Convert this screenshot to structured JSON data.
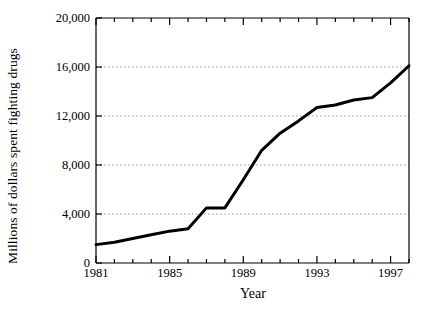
{
  "chart_data": {
    "type": "line",
    "title": "",
    "xlabel": "Year",
    "ylabel": "Millions of dollars spent fighting drugs",
    "x": [
      1981,
      1982,
      1983,
      1984,
      1985,
      1986,
      1987,
      1988,
      1989,
      1990,
      1991,
      1992,
      1993,
      1994,
      1995,
      1996,
      1997,
      1998
    ],
    "values": [
      1500,
      1700,
      2000,
      2300,
      2600,
      2800,
      4500,
      4500,
      6800,
      9200,
      10600,
      11600,
      12700,
      12900,
      13300,
      13500,
      14700,
      16100
    ],
    "series": [
      {
        "name": "Millions of dollars spent fighting drugs",
        "values": [
          1500,
          1700,
          2000,
          2300,
          2600,
          2800,
          4500,
          4500,
          6800,
          9200,
          10600,
          11600,
          12700,
          12900,
          13300,
          13500,
          14700,
          16100
        ]
      }
    ],
    "xlim": [
      1981,
      1998
    ],
    "ylim": [
      0,
      20000
    ],
    "ytick_values": [
      0,
      4000,
      8000,
      12000,
      16000,
      20000
    ],
    "ytick_labels": [
      "0",
      "4,000",
      "8,000",
      "12,000",
      "16,000",
      "20,000"
    ],
    "xtick_values": [
      1981,
      1982,
      1983,
      1984,
      1985,
      1986,
      1987,
      1988,
      1989,
      1990,
      1991,
      1992,
      1993,
      1994,
      1995,
      1996,
      1997,
      1998
    ],
    "xtick_labels_shown": [
      {
        "value": 1981,
        "label": "1981"
      },
      {
        "value": 1985,
        "label": "1985"
      },
      {
        "value": 1989,
        "label": "1989"
      },
      {
        "value": 1993,
        "label": "1993"
      },
      {
        "value": 1997,
        "label": "1997"
      }
    ],
    "grid": {
      "horizontal": true,
      "vertical": false,
      "style": "dotted",
      "color": "#999999"
    },
    "legend": {
      "visible": false,
      "position": "none"
    },
    "line_color": "#000000",
    "line_width": 3,
    "axis_color": "#000000",
    "background_color": "#ffffff"
  },
  "axes": {
    "y_title": "Millions of dollars spent fighting drugs",
    "x_title": "Year"
  }
}
